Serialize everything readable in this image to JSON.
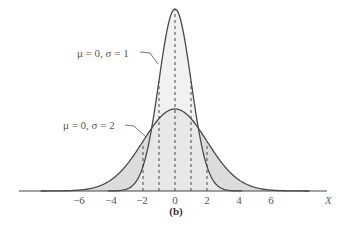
{
  "chart_data": {
    "type": "line",
    "title": "",
    "caption": "(b)",
    "xlabel": "X",
    "ylabel": "",
    "xlim": [
      -9.8,
      9.5
    ],
    "xticks": [
      -6,
      -4,
      -2,
      0,
      2,
      4,
      6
    ],
    "xtick_labels": [
      "−6",
      "−4",
      "−2",
      "0",
      "2",
      "4",
      "6"
    ],
    "grid": false,
    "legend_position": "inline annotations",
    "series": [
      {
        "name": "μ = 0, σ = 1",
        "mu": 0,
        "sigma": 1,
        "peak": 0.399,
        "fill": "#ececec",
        "dashed_verticals": [
          -1,
          0,
          1
        ]
      },
      {
        "name": "μ = 0, σ = 2",
        "mu": 0,
        "sigma": 2,
        "peak": 0.199,
        "fill": "#dcdcdc",
        "dashed_verticals": [
          -2,
          -1,
          0,
          1,
          2
        ]
      }
    ],
    "annotations": [
      {
        "text": "μ = 0, σ = 1",
        "points_to": "sigma=1 curve at x≈-1.1"
      },
      {
        "text": "μ = 0, σ = 2",
        "points_to": "sigma=2 curve at x≈-1.8"
      }
    ]
  },
  "labels": {
    "s1": "μ = 0, σ = 1",
    "s2": "μ = 0, σ = 2",
    "x_axis": "X",
    "caption": "(b)",
    "ticks": [
      "−6",
      "−4",
      "−2",
      "0",
      "2",
      "4",
      "6"
    ]
  }
}
